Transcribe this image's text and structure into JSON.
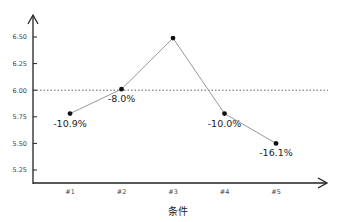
{
  "chart_data": {
    "type": "line",
    "title": "",
    "xlabel": "条件",
    "ylabel": "",
    "categories": [
      "#1",
      "#2",
      "#3",
      "#4",
      "#5"
    ],
    "series": [
      {
        "name": "values",
        "values": [
          5.78,
          6.01,
          6.49,
          5.78,
          5.5
        ],
        "labels": [
          "-10.9%",
          "-8.0%",
          "",
          "-10.0%",
          "-16.1%"
        ]
      }
    ],
    "yticks": [
      "5.25",
      "5.50",
      "5.75",
      "6.00",
      "6.25",
      "6.50"
    ],
    "ylim": [
      5.1,
      6.6
    ],
    "reference_line": {
      "y": 6.0,
      "style": "dotted"
    },
    "grid": false,
    "legend": null
  }
}
